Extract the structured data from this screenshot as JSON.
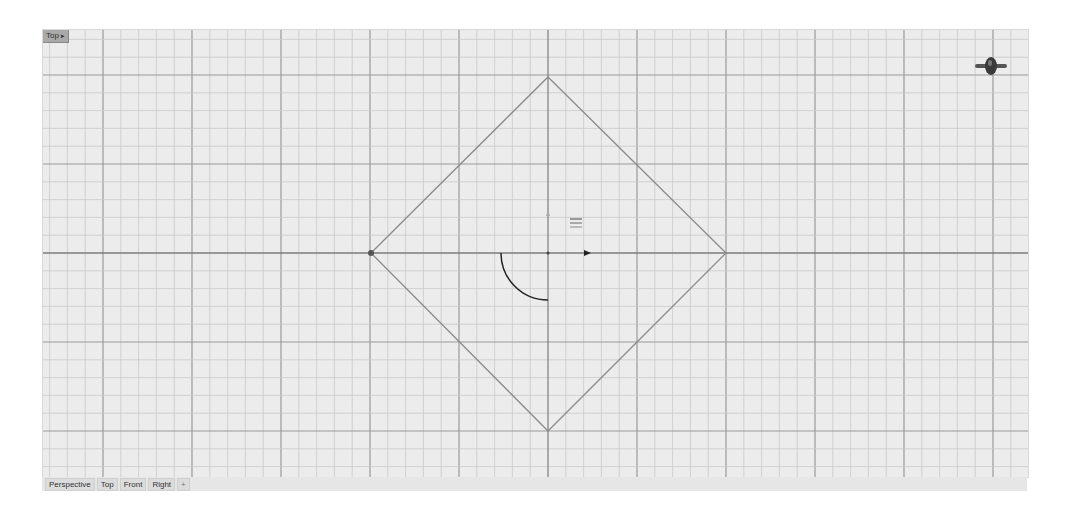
{
  "viewport": {
    "label": "Top",
    "menu_arrow": "▸",
    "background": "#ececec",
    "grid": {
      "minor_spacing_px": 17.8,
      "major_every": 5,
      "minor_color": "#c9c9c9",
      "major_color": "#9a9a9a",
      "axis_color": "#7d7d7d"
    },
    "origin_px": [
      505,
      223
    ],
    "geometry": {
      "diamond": {
        "top": [
          505,
          47
        ],
        "right": [
          683,
          223
        ],
        "bottom": [
          505,
          401
        ],
        "left": [
          328,
          223
        ],
        "color": "#8a8a8a"
      },
      "arc": {
        "center": [
          505,
          223
        ],
        "radius": 47,
        "start_deg": 180,
        "end_deg": 90,
        "color": "#222222"
      }
    }
  },
  "tabs": [
    {
      "label": "Perspective"
    },
    {
      "label": "Top"
    },
    {
      "label": "Front"
    },
    {
      "label": "Right"
    },
    {
      "label": "+"
    }
  ],
  "icons": {
    "navigation_widget": "view-navigation-icon",
    "gumball": "gumball-arrow-icon",
    "osnap": "osnap-marker-icon"
  }
}
